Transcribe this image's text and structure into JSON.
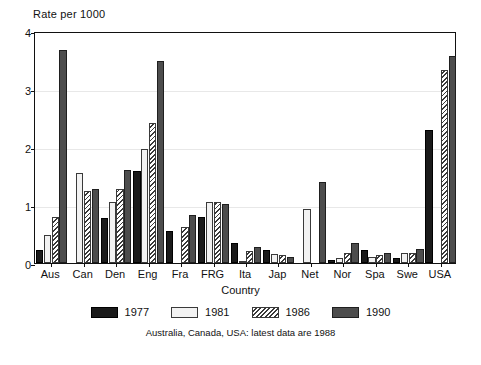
{
  "chart_data": {
    "type": "bar",
    "title": "",
    "ylabel": "Rate per 1000",
    "xlabel": "Country",
    "ylim": [
      0,
      4
    ],
    "yticks": [
      0,
      1,
      2,
      3,
      4
    ],
    "grid": true,
    "legend_position": "bottom",
    "footnote": "Australia, Canada, USA: latest data are 1988",
    "categories": [
      "Aus",
      "Can",
      "Den",
      "Eng",
      "Fra",
      "FRG",
      "Ita",
      "Jap",
      "Net",
      "Nor",
      "Spa",
      "Swe",
      "USA"
    ],
    "series": [
      {
        "name": "1977",
        "color": "#1a1a1a",
        "pattern": "solid-black",
        "values": [
          0.22,
          null,
          0.78,
          1.59,
          0.56,
          0.8,
          0.35,
          0.22,
          null,
          0.06,
          0.22,
          0.08,
          2.29
        ]
      },
      {
        "name": "1981",
        "color": "#f2f2f2",
        "pattern": "solid-white",
        "values": [
          0.49,
          1.56,
          1.05,
          1.96,
          null,
          1.06,
          0.02,
          0.16,
          0.93,
          0.09,
          0.1,
          0.18,
          null
        ]
      },
      {
        "name": "1986",
        "color": "#ffffff",
        "pattern": "diagonal-hatch",
        "values": [
          0.8,
          1.24,
          1.27,
          2.41,
          0.62,
          1.06,
          0.21,
          0.13,
          null,
          0.18,
          0.13,
          0.17,
          3.33
        ]
      },
      {
        "name": "1990",
        "color": "#4d4d4d",
        "pattern": "solid-gray",
        "values": [
          3.68,
          1.28,
          1.6,
          3.48,
          0.82,
          1.02,
          0.27,
          0.1,
          1.39,
          0.35,
          0.17,
          0.25,
          3.57
        ]
      }
    ]
  }
}
